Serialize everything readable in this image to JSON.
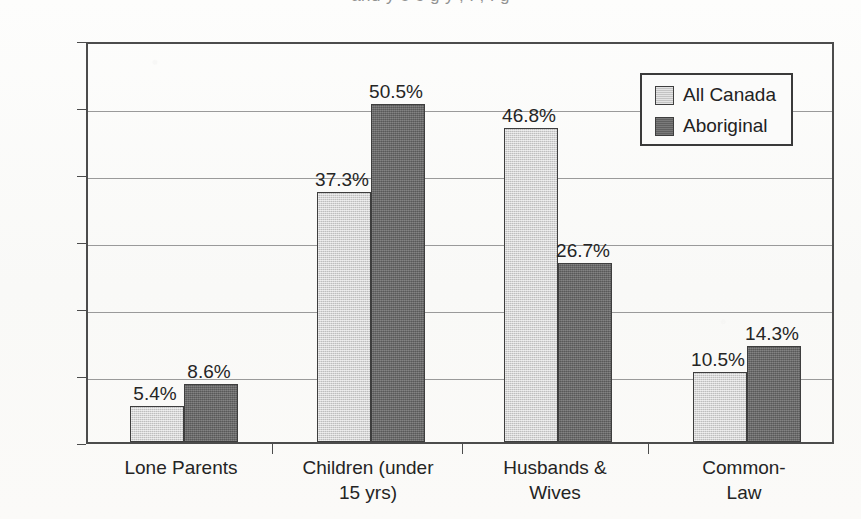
{
  "clipped_title_fragment": "and y  e  o g y ,     .     ,     .        g",
  "colors": {
    "series_all_canada": "#c9c9c9",
    "series_aboriginal": "#6b6b6b",
    "axis": "#4c4c4c",
    "gridline": "#9a9a9a",
    "text": "#242424",
    "background": "#fbfbfa"
  },
  "legend": {
    "position": "top-right-inside",
    "entries": [
      {
        "label": "All Canada",
        "swatch": "light-gray-swatch"
      },
      {
        "label": "Aboriginal",
        "swatch": "dark-gray-swatch"
      }
    ]
  },
  "chart_data": {
    "type": "bar",
    "title": "",
    "xlabel": "",
    "ylabel": "",
    "ylim": [
      0,
      60
    ],
    "ytick_labels": [
      "0%",
      "10%",
      "20%",
      "30%",
      "40%",
      "50%",
      "60%"
    ],
    "ytick_values": [
      0,
      10,
      20,
      30,
      40,
      50,
      60
    ],
    "grid": true,
    "grid_axis": "y",
    "legend_position": "upper right",
    "categories": [
      "Lone Parents",
      "Children (under\n15 yrs)",
      "Husbands &\nWives",
      "Common-Law"
    ],
    "series": [
      {
        "name": "All Canada",
        "color": "#c9c9c9",
        "values": [
          5.4,
          37.3,
          46.8,
          10.5
        ],
        "labels": [
          "5.4%",
          "37.3%",
          "46.8%",
          "10.5%"
        ]
      },
      {
        "name": "Aboriginal",
        "color": "#6b6b6b",
        "values": [
          8.6,
          50.5,
          26.7,
          14.3
        ],
        "labels": [
          "8.6%",
          "50.5%",
          "26.7%",
          "14.3%"
        ]
      }
    ]
  },
  "layout": {
    "plot_left": 86,
    "plot_top": 42,
    "plot_width": 748,
    "plot_height": 402,
    "bar_width": 54,
    "group_centers": [
      181,
      368,
      555,
      744
    ],
    "category_tick_x": [
      272,
      462,
      648
    ],
    "bar_left_offsets": [
      -53,
      1
    ]
  }
}
